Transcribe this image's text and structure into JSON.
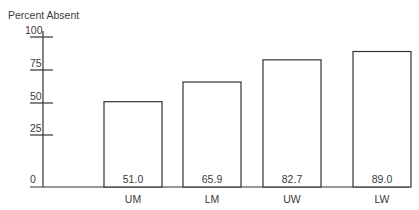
{
  "chart_data": {
    "type": "bar",
    "title": "",
    "ylabel": "Percent Absent",
    "xlabel": "",
    "categories": [
      "UM",
      "LM",
      "UW",
      "LW"
    ],
    "values": [
      51.0,
      65.9,
      82.7,
      89.0
    ],
    "value_labels": [
      "51.0",
      "65.9",
      "82.7",
      "89.0"
    ],
    "yticks": [
      0,
      25,
      50,
      75,
      100
    ],
    "ytick_labels": [
      "0",
      "25",
      "50",
      "75",
      "100"
    ],
    "ylim": [
      0,
      100
    ],
    "grid": false,
    "legend": null
  }
}
